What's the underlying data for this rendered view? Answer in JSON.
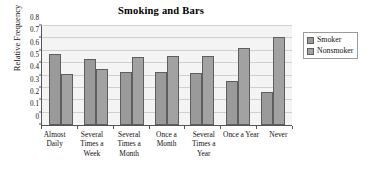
{
  "chart_data": {
    "type": "bar",
    "title": "Smoking and Bars",
    "xlabel": "",
    "ylabel": "Relative Frequency",
    "categories": [
      "Almost Daily",
      "Several Times a Week",
      "Several Times a Month",
      "Once a Month",
      "Several Times a Year",
      "Once a Year",
      "Never"
    ],
    "series": [
      {
        "name": "Smoker",
        "color": "#9a9a9a",
        "values": [
          0.575,
          0.53,
          0.43,
          0.43,
          0.42,
          0.355,
          0.265
        ]
      },
      {
        "name": "Nonsmoker",
        "color": "#a2a2a2",
        "values": [
          0.41,
          0.45,
          0.55,
          0.555,
          0.56,
          0.62,
          0.71
        ]
      }
    ],
    "ylim": [
      0,
      0.8
    ],
    "yticks": [
      "0",
      "0.1",
      "0.2",
      "0.3",
      "0.4",
      "0.5",
      "0.6",
      "0.7",
      "0.8"
    ],
    "ytick_values": [
      0,
      0.1,
      0.2,
      0.3,
      0.4,
      0.5,
      0.6,
      0.7,
      0.8
    ],
    "grid": true,
    "legend_position": "right",
    "plot_background": "#f4f4f4",
    "grid_color": "#d0d0d0",
    "axis_color": "#555555",
    "bar_border_color": "#5e5e5e"
  },
  "legend": {
    "entries": [
      {
        "label": "Smoker"
      },
      {
        "label": "Nonsmoker"
      }
    ]
  }
}
